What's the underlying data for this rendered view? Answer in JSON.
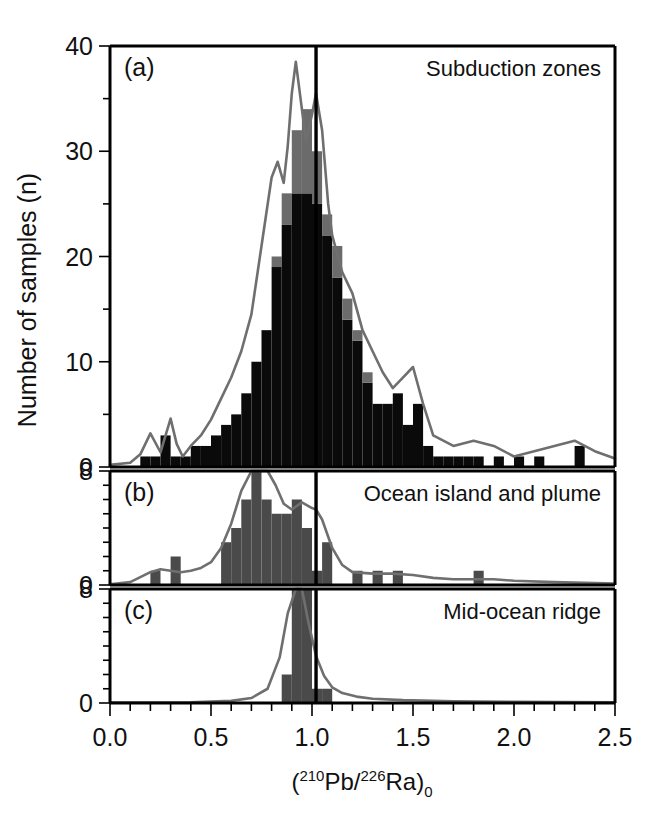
{
  "figure": {
    "ylabel": "Number of samples (n)",
    "xlabel_prefix": "(",
    "xlabel_sup1": "210",
    "xlabel_el1": "Pb/",
    "xlabel_sup2": "226",
    "xlabel_el2": "Ra",
    "xlabel_close": ")",
    "xlabel_sub": "0",
    "xlabel_plain": "(210Pb/226Ra)0",
    "reference_line_value": 1.02,
    "colors": {
      "bar_black": "#0a0a0a",
      "bar_gray": "#6b6b6b",
      "bar_dark_gray": "#4a4a4a",
      "kde_curve": "#6f6f6f",
      "axis": "#000000",
      "background": "#ffffff"
    }
  },
  "chart_data": [
    {
      "type": "bar",
      "panel": "a",
      "panel_tag": "(a)",
      "title": "Subduction zones",
      "xlabel": "(210Pb/226Ra)0",
      "ylabel": "Number of samples (n)",
      "xlim": [
        0.0,
        2.5
      ],
      "ylim": [
        0,
        40
      ],
      "xticks": [
        0.0,
        0.5,
        1.0,
        1.5,
        2.0,
        2.5
      ],
      "xtick_labels": [
        "0.0",
        "0.5",
        "1.0",
        "1.5",
        "2.0",
        "2.5"
      ],
      "yticks": [
        0,
        10,
        20,
        30,
        40
      ],
      "ytick_labels": [
        "0",
        "10",
        "20",
        "30",
        "40"
      ],
      "yminor_step": 5,
      "xminor_step": 0.1,
      "grid": false,
      "bin_width": 0.05,
      "bin_starts": [
        0.15,
        0.2,
        0.25,
        0.3,
        0.35,
        0.4,
        0.45,
        0.5,
        0.55,
        0.6,
        0.65,
        0.7,
        0.75,
        0.8,
        0.85,
        0.9,
        0.95,
        1.0,
        1.05,
        1.1,
        1.15,
        1.2,
        1.25,
        1.3,
        1.35,
        1.4,
        1.45,
        1.5,
        1.55,
        1.6,
        1.65,
        1.7,
        1.75,
        1.8,
        1.85,
        1.9,
        1.95,
        2.0,
        2.05,
        2.1,
        2.15,
        2.2,
        2.25,
        2.3,
        2.35,
        2.4,
        2.45
      ],
      "series": [
        {
          "name": "total (black)",
          "color": "#0a0a0a",
          "values": [
            1,
            1,
            3,
            1,
            1,
            2,
            2,
            3,
            4,
            5,
            7,
            10,
            13,
            19,
            23,
            26,
            26,
            25,
            22,
            18,
            14,
            12,
            8,
            6,
            6,
            7,
            4,
            6,
            2,
            1,
            1,
            1,
            1,
            1,
            0,
            1,
            0,
            1,
            0,
            1,
            0,
            0,
            0,
            2,
            0,
            0,
            0
          ]
        },
        {
          "name": "gray cap segment",
          "color": "#6b6b6b",
          "values": [
            0,
            0,
            0,
            0,
            0,
            0,
            0,
            0,
            0,
            0,
            0,
            0,
            0,
            1,
            3,
            6,
            8,
            5,
            2,
            3,
            2,
            1,
            1,
            0,
            0,
            0,
            0,
            0,
            0,
            0,
            0,
            0,
            0,
            0,
            0,
            0,
            0,
            0,
            0,
            0,
            0,
            0,
            0,
            0,
            0,
            0,
            0
          ]
        }
      ],
      "stacked_totals": [
        1,
        1,
        3,
        1,
        1,
        2,
        2,
        3,
        4,
        5,
        7,
        10,
        13,
        20,
        26,
        32,
        34,
        30,
        24,
        21,
        16,
        13,
        9,
        6,
        6,
        7,
        4,
        6,
        2,
        1,
        1,
        1,
        1,
        1,
        0,
        1,
        0,
        1,
        0,
        1,
        0,
        0,
        0,
        2,
        0,
        0,
        0
      ],
      "kde": {
        "name": "smoothed density",
        "color": "#6f6f6f",
        "x": [
          0.0,
          0.1,
          0.15,
          0.2,
          0.25,
          0.3,
          0.33,
          0.36,
          0.4,
          0.45,
          0.5,
          0.55,
          0.6,
          0.65,
          0.7,
          0.75,
          0.8,
          0.83,
          0.86,
          0.88,
          0.9,
          0.92,
          0.95,
          0.97,
          1.0,
          1.02,
          1.05,
          1.08,
          1.1,
          1.15,
          1.2,
          1.25,
          1.3,
          1.35,
          1.4,
          1.45,
          1.5,
          1.55,
          1.6,
          1.7,
          1.8,
          1.9,
          2.0,
          2.1,
          2.2,
          2.3,
          2.4,
          2.5
        ],
        "y": [
          0.2,
          0.4,
          1.2,
          3.2,
          1.4,
          4.6,
          2.2,
          1.0,
          2.0,
          3.0,
          4.5,
          6.5,
          8.5,
          11.0,
          14.5,
          21.0,
          27.5,
          29.0,
          27.0,
          30.5,
          35.5,
          38.5,
          34.0,
          31.0,
          33.5,
          35.5,
          32.0,
          25.0,
          22.0,
          18.5,
          16.5,
          13.0,
          11.0,
          9.0,
          7.5,
          8.5,
          9.5,
          6.0,
          3.0,
          2.0,
          2.5,
          2.0,
          1.0,
          1.5,
          2.0,
          2.5,
          1.5,
          0.8
        ]
      }
    },
    {
      "type": "bar",
      "panel": "b",
      "panel_tag": "(b)",
      "title": "Ocean island and plume",
      "xlim": [
        0.0,
        2.5
      ],
      "ylim": [
        0,
        8
      ],
      "yticks": [
        0,
        8
      ],
      "ytick_labels": [
        "0",
        "8"
      ],
      "yminor_step": 1,
      "grid": false,
      "bin_width": 0.05,
      "bin_starts": [
        0.2,
        0.25,
        0.3,
        0.35,
        0.4,
        0.45,
        0.5,
        0.55,
        0.6,
        0.65,
        0.7,
        0.75,
        0.8,
        0.85,
        0.9,
        0.95,
        1.0,
        1.05,
        1.1,
        1.15,
        1.2,
        1.25,
        1.3,
        1.35,
        1.4,
        1.45,
        1.5,
        1.55,
        1.6,
        1.65,
        1.7,
        1.75,
        1.8,
        1.85,
        1.9
      ],
      "series": [
        {
          "name": "counts",
          "color": "#4a4a4a",
          "values": [
            1,
            0,
            2,
            0,
            0,
            0,
            0,
            3,
            4,
            6,
            8,
            6,
            5,
            5,
            6,
            4,
            1,
            3,
            0,
            0,
            1,
            0,
            1,
            0,
            1,
            0,
            0,
            0,
            0,
            0,
            0,
            0,
            1,
            0,
            0
          ]
        }
      ],
      "kde": {
        "name": "smoothed density",
        "color": "#6f6f6f",
        "x": [
          0.0,
          0.1,
          0.2,
          0.25,
          0.3,
          0.35,
          0.4,
          0.45,
          0.5,
          0.55,
          0.6,
          0.65,
          0.7,
          0.75,
          0.78,
          0.82,
          0.86,
          0.9,
          0.95,
          1.0,
          1.02,
          1.05,
          1.1,
          1.15,
          1.2,
          1.3,
          1.4,
          1.5,
          1.6,
          1.7,
          1.8,
          1.9,
          2.0,
          2.2,
          2.5
        ],
        "y": [
          0.05,
          0.2,
          0.9,
          1.1,
          1.0,
          0.9,
          1.0,
          1.2,
          1.6,
          2.6,
          4.3,
          6.6,
          8.1,
          8.4,
          8.3,
          7.0,
          5.7,
          5.3,
          5.8,
          5.4,
          5.3,
          4.6,
          2.6,
          1.4,
          0.9,
          0.8,
          0.8,
          0.7,
          0.5,
          0.4,
          0.4,
          0.4,
          0.3,
          0.2,
          0.1
        ]
      }
    },
    {
      "type": "bar",
      "panel": "c",
      "panel_tag": "(c)",
      "title": "Mid-ocean ridge",
      "xlim": [
        0.0,
        2.5
      ],
      "ylim": [
        0,
        8
      ],
      "yticks": [
        0,
        8
      ],
      "ytick_labels": [
        "0",
        "8"
      ],
      "yminor_step": 1,
      "grid": false,
      "bin_width": 0.05,
      "bin_starts": [
        0.8,
        0.85,
        0.9,
        0.95,
        1.0,
        1.05,
        1.1
      ],
      "series": [
        {
          "name": "counts",
          "color": "#4a4a4a",
          "values": [
            0,
            2,
            8,
            8,
            1,
            1,
            0
          ]
        }
      ],
      "kde": {
        "name": "smoothed density",
        "color": "#6f6f6f",
        "x": [
          0.0,
          0.4,
          0.6,
          0.7,
          0.78,
          0.84,
          0.88,
          0.92,
          0.95,
          0.98,
          1.02,
          1.06,
          1.1,
          1.15,
          1.22,
          1.3,
          1.45,
          1.7,
          2.0,
          2.5
        ],
        "y": [
          0.03,
          0.05,
          0.15,
          0.35,
          1.0,
          3.2,
          6.3,
          8.4,
          8.0,
          5.8,
          3.3,
          1.9,
          1.1,
          0.7,
          0.45,
          0.3,
          0.2,
          0.12,
          0.08,
          0.05
        ]
      }
    }
  ]
}
